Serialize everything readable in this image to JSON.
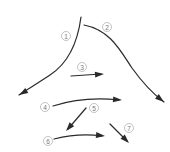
{
  "diagram": {
    "type": "numbered-arrows",
    "stroke_color": "#2a2a2a",
    "label_color": "#777777",
    "arrows": [
      {
        "id": "1",
        "label": "1",
        "path": "M81,17 C78,40 70,62 50,75 C38,83 28,89 19,95",
        "tip": [
          19,
          95
        ],
        "angle": 150,
        "label_pos": [
          66,
          36
        ]
      },
      {
        "id": "2",
        "label": "2",
        "path": "M84,25 C110,30 120,50 132,68 C142,82 152,93 164,102",
        "tip": [
          164,
          102
        ],
        "angle": 38,
        "label_pos": [
          107,
          27
        ]
      },
      {
        "id": "3",
        "label": "3",
        "path": "M71,76 L101,74",
        "tip": [
          104,
          74
        ],
        "angle": -4,
        "label_pos": [
          82,
          67
        ]
      },
      {
        "id": "4",
        "label": "4",
        "path": "M53,106 C75,99 100,98 119,100",
        "tip": [
          122,
          100
        ],
        "angle": 4,
        "label_pos": [
          45,
          107
        ]
      },
      {
        "id": "5",
        "label": "5",
        "path": "M86,108 L68,129",
        "tip": [
          66,
          131
        ],
        "angle": 131,
        "label_pos": [
          94,
          108
        ]
      },
      {
        "id": "6",
        "label": "6",
        "path": "M54,139 C70,135 88,134 102,136",
        "tip": [
          105,
          136
        ],
        "angle": 6,
        "label_pos": [
          48,
          141
        ]
      },
      {
        "id": "7",
        "label": "7",
        "path": "M110,124 L127,141",
        "tip": [
          129,
          143
        ],
        "angle": 45,
        "label_pos": [
          129,
          128
        ]
      }
    ]
  }
}
